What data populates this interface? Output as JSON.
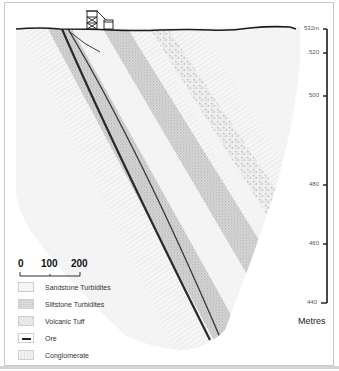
{
  "diagram": {
    "type": "geological-cross-section",
    "surface_structures": [
      "headframe",
      "building"
    ]
  },
  "depth_scale": {
    "ticks": [
      {
        "label": "532m",
        "y": 29
      },
      {
        "label": "520",
        "y": 53
      },
      {
        "label": "500",
        "y": 96
      },
      {
        "label": "480",
        "y": 185
      },
      {
        "label": "460",
        "y": 244
      },
      {
        "label": "440",
        "y": 303
      }
    ],
    "unit_label": "Metres"
  },
  "scale_bar": {
    "labels": [
      "0",
      "100",
      "200"
    ]
  },
  "legend": {
    "items": [
      {
        "label": "Sandstone Turbidites",
        "pattern": "sandstone",
        "color": "#f3f3f3"
      },
      {
        "label": "Siltstone Turbidites",
        "pattern": "siltstone",
        "color": "#dcdcdc"
      },
      {
        "label": "Volcanic Tuff",
        "pattern": "tuff",
        "color": "#e8e8e8"
      },
      {
        "label": "Ore",
        "pattern": "ore",
        "color": "#222222"
      },
      {
        "label": "Conglomerate",
        "pattern": "conglomerate",
        "color": "#efefef"
      }
    ]
  },
  "colors": {
    "surface_line": "#1a1a1a",
    "ore": "#2a2a2a",
    "scale_axis": "#1a1a1a"
  }
}
